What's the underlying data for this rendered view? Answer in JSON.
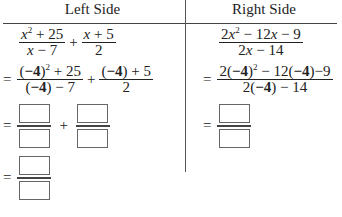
{
  "table": {
    "headers": {
      "left": "Left Side",
      "right": "Right Side"
    },
    "left": {
      "row1": {
        "frac1": {
          "num": "x² + 25",
          "den": "x − 7"
        },
        "op": "+",
        "frac2": {
          "num": "x + 5",
          "den": "2"
        }
      },
      "row2": {
        "eq": "=",
        "frac1": {
          "num": "(−4)² + 25",
          "den": "(−4) − 7"
        },
        "op": "+",
        "frac2": {
          "num": "(−4) + 5",
          "den": "2"
        },
        "substituted_value": "−4"
      },
      "row3": {
        "eq": "=",
        "op": "+",
        "boxes": [
          "",
          "",
          "",
          ""
        ]
      },
      "row4": {
        "eq": "=",
        "boxes": [
          "",
          ""
        ]
      }
    },
    "right": {
      "row1": {
        "frac": {
          "num": "2x² − 12x − 9",
          "den": "2x − 14"
        }
      },
      "row2": {
        "eq": "=",
        "frac": {
          "num": "2(−4)² − 12(−4)−9",
          "den": "2(−4) − 14"
        },
        "substituted_value": "−4"
      },
      "row3": {
        "eq": "=",
        "boxes": [
          "",
          ""
        ]
      }
    }
  }
}
